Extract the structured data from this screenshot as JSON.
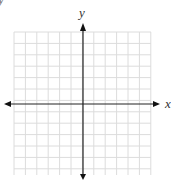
{
  "diagram": {
    "type": "coordinate-plane",
    "axes": {
      "x_label": "x",
      "y_label": "y"
    },
    "corner_fragment": "y",
    "grid": {
      "left": 14,
      "top": 32,
      "right": 151,
      "bottom": 175,
      "cell": 11.4,
      "color": "#dcdcdc"
    },
    "origin": {
      "x": 83,
      "y": 104
    },
    "axis_color": "#222222"
  }
}
